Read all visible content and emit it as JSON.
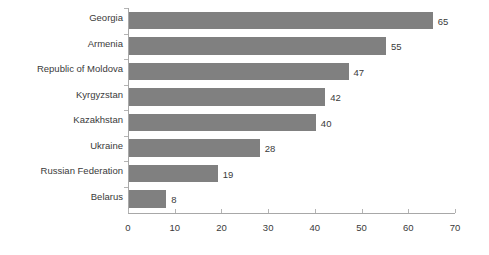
{
  "chart_data": {
    "type": "bar",
    "orientation": "horizontal",
    "title": "",
    "subtitle": "",
    "xlabel": "",
    "ylabel": "",
    "categories": [
      "Georgia",
      "Armenia",
      "Republic of Moldova",
      "Kyrgyzstan",
      "Kazakhstan",
      "Ukraine",
      "Russian Federation",
      "Belarus"
    ],
    "values": [
      65,
      55,
      47,
      42,
      40,
      28,
      19,
      8
    ],
    "data_labels": [
      "65",
      "55",
      "47",
      "42",
      "40",
      "28",
      "19",
      "8"
    ],
    "xlim": [
      0,
      70
    ],
    "xticks": [
      0,
      10,
      20,
      30,
      40,
      50,
      60,
      70
    ],
    "xtick_labels": [
      "0",
      "10",
      "20",
      "30",
      "40",
      "50",
      "60",
      "70"
    ],
    "grid": false,
    "legend": null,
    "bar_color": "#808080",
    "axis_color": "#a8a8a8",
    "text_color": "#3a3a3a",
    "background_color": "#ffffff"
  }
}
